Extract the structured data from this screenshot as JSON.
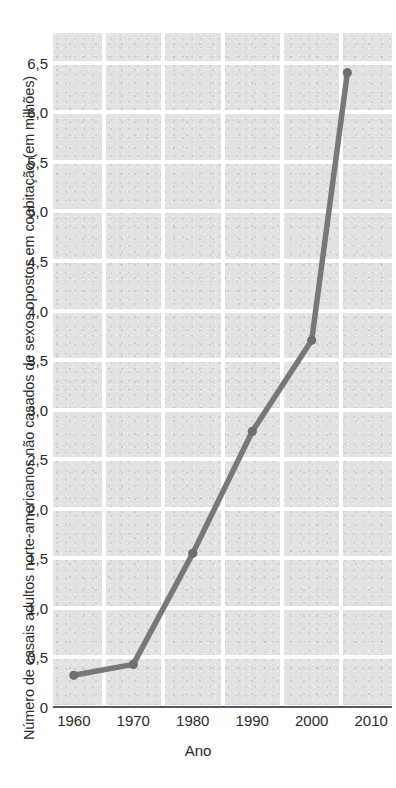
{
  "chart_data": {
    "type": "line",
    "title": "",
    "xlabel": "Ano",
    "ylabel": "Número de casais adultos norte-americanos não casados de sexos opostos em coabitação (em milhões)",
    "x": [
      1960,
      1970,
      1980,
      1990,
      2000,
      2006
    ],
    "values": [
      0.32,
      0.43,
      1.55,
      2.78,
      3.7,
      6.4
    ],
    "series": [
      {
        "name": "Casais em coabitação",
        "values": [
          0.32,
          0.43,
          1.55,
          2.78,
          3.7,
          6.4
        ]
      }
    ],
    "xlim": [
      1956.5,
      2013.5
    ],
    "ylim": [
      0,
      6.8
    ],
    "xticks": [
      1960,
      1970,
      1980,
      1990,
      2000,
      2010
    ],
    "xtick_labels": [
      "1960",
      "1970",
      "1980",
      "1990",
      "2000",
      "2010"
    ],
    "yticks": [
      0,
      0.5,
      1.0,
      1.5,
      2.0,
      2.5,
      3.0,
      3.5,
      4.0,
      4.5,
      5.0,
      5.5,
      6.0,
      6.5
    ],
    "ytick_labels": [
      "0",
      "0,5",
      "1,0",
      "1,5",
      "2,0",
      "2,5",
      "3,0",
      "3,5",
      "4,0",
      "4,5",
      "5,0",
      "5,5",
      "6,0",
      "6,5"
    ],
    "grid": true,
    "legend": "none",
    "markers": true,
    "colors": {
      "line": "#787878",
      "marker": "#6e6e6e",
      "panel": "#e2e2e2",
      "gridline": "#ffffff",
      "axis": "#5a5a5a",
      "text": "#2b2b2b",
      "page_background": "#ffffff"
    }
  }
}
